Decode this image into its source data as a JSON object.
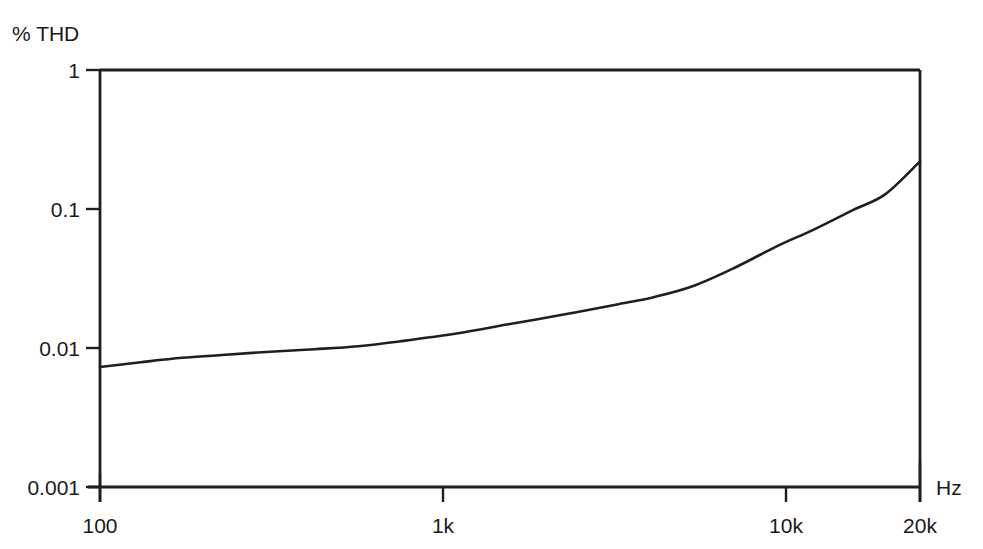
{
  "chart_data": {
    "type": "line",
    "title": "",
    "subtitle": "",
    "ylabel": "% THD",
    "xlabel": "Hz",
    "xscale": "log",
    "yscale": "log",
    "xlim": [
      100,
      20000
    ],
    "ylim": [
      0.001,
      1
    ],
    "grid": false,
    "legend": null,
    "x_tick_labels": [
      "100",
      "1k",
      "10k",
      "20k"
    ],
    "x_tick_values": [
      100,
      1000,
      10000,
      20000
    ],
    "y_tick_labels": [
      "1",
      "0.1",
      "0.01",
      "0.001"
    ],
    "y_tick_values": [
      1,
      0.1,
      0.01,
      0.001
    ],
    "series": [
      {
        "name": "THD vs Frequency",
        "x": [
          100,
          130,
          170,
          220,
          300,
          400,
          530,
          700,
          1000,
          1400,
          2000,
          2800,
          3600,
          4600,
          6000,
          8000,
          10000,
          13000,
          16000,
          20000
        ],
        "values": [
          0.0073,
          0.0079,
          0.0085,
          0.0089,
          0.0094,
          0.0098,
          0.0103,
          0.0112,
          0.0127,
          0.0148,
          0.0174,
          0.0205,
          0.0233,
          0.0278,
          0.0375,
          0.0545,
          0.0705,
          0.0985,
          0.128,
          0.22
        ]
      }
    ]
  },
  "axes": {
    "y_axis_title": "% THD",
    "x_axis_title": "Hz",
    "y_ticks": [
      {
        "label": "1",
        "value": 1
      },
      {
        "label": "0.1",
        "value": 0.1
      },
      {
        "label": "0.01",
        "value": 0.01
      },
      {
        "label": "0.001",
        "value": 0.001
      }
    ],
    "x_ticks": [
      {
        "label": "100",
        "value": 100
      },
      {
        "label": "1k",
        "value": 1000
      },
      {
        "label": "10k",
        "value": 10000
      },
      {
        "label": "20k",
        "value": 20000
      }
    ]
  },
  "colors": {
    "curve": "#1f1f1f",
    "axis": "#1f1f1f",
    "text": "#1a1a1a",
    "background": "#ffffff"
  }
}
